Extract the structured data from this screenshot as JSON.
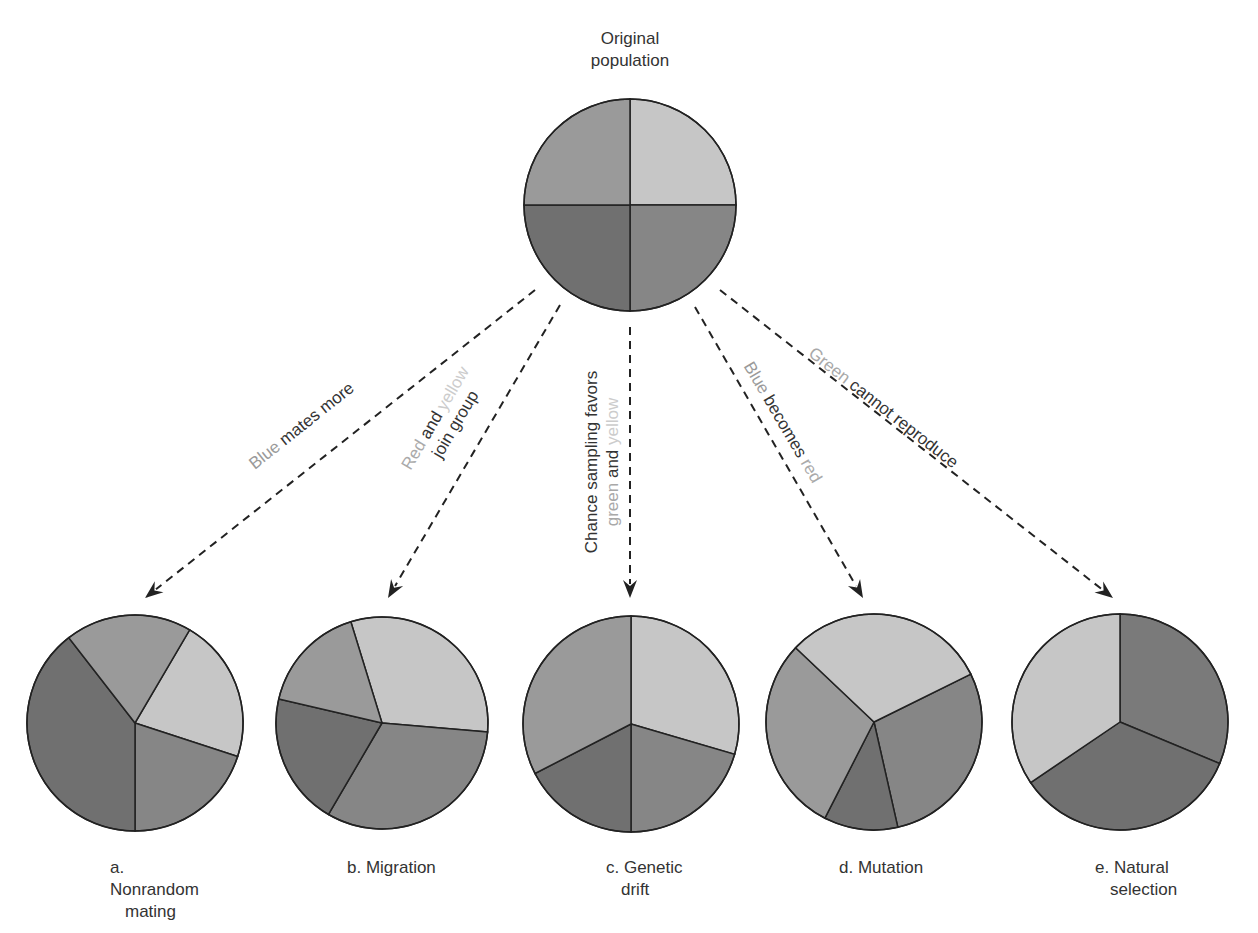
{
  "title": {
    "line1": "Original",
    "line2": "population"
  },
  "shades": {
    "green": "#9a9a9a",
    "yellow": "#c6c6c6",
    "blue": "#707070",
    "red": "#868686",
    "stroke": "#222222"
  },
  "word_colors": {
    "blue": "#9a9a9a",
    "red": "#aaaaaa",
    "yellow": "#cccccc",
    "green": "#a8a8a8",
    "text": "#333333"
  },
  "arrows": [
    {
      "id": "a",
      "words": [
        {
          "t": "Blue",
          "c": "blue"
        },
        {
          "t": " mates more",
          "c": "text"
        }
      ]
    },
    {
      "id": "b",
      "line1": [
        {
          "t": "Red",
          "c": "red"
        },
        {
          "t": " and ",
          "c": "text"
        },
        {
          "t": "yellow",
          "c": "yellow"
        }
      ],
      "line2": [
        {
          "t": "join group",
          "c": "text"
        }
      ]
    },
    {
      "id": "c",
      "line1": [
        {
          "t": "Chance sampling favors",
          "c": "text"
        }
      ],
      "line2": [
        {
          "t": "green",
          "c": "green"
        },
        {
          "t": " and ",
          "c": "text"
        },
        {
          "t": "yellow",
          "c": "yellow"
        }
      ]
    },
    {
      "id": "d",
      "words": [
        {
          "t": "Blue",
          "c": "blue"
        },
        {
          "t": " becomes ",
          "c": "text"
        },
        {
          "t": "red",
          "c": "red"
        }
      ]
    },
    {
      "id": "e",
      "words": [
        {
          "t": "Green",
          "c": "green"
        },
        {
          "t": " cannot reproduce",
          "c": "text"
        }
      ]
    }
  ],
  "captions": [
    {
      "l1": "a. Nonrandom",
      "l2": "mating"
    },
    {
      "l1": "b. Migration",
      "l2": ""
    },
    {
      "l1": "c. Genetic",
      "l2": "drift"
    },
    {
      "l1": "d. Mutation",
      "l2": ""
    },
    {
      "l1": "e. Natural",
      "l2": "selection"
    }
  ],
  "chart_data": [
    {
      "type": "pie",
      "title": "Original population",
      "categories": [
        "green",
        "yellow",
        "red",
        "blue"
      ],
      "values": [
        25,
        25,
        25,
        25
      ]
    },
    {
      "type": "pie",
      "title": "a. Nonrandom mating",
      "categories": [
        "green",
        "yellow",
        "red",
        "blue"
      ],
      "values": [
        16,
        17,
        20,
        47
      ]
    },
    {
      "type": "pie",
      "title": "b. Migration",
      "categories": [
        "green",
        "yellow",
        "red",
        "blue"
      ],
      "values": [
        16,
        33,
        36,
        15
      ]
    },
    {
      "type": "pie",
      "title": "c. Genetic drift",
      "categories": [
        "green",
        "yellow",
        "red",
        "blue"
      ],
      "values": [
        35,
        30,
        17,
        18
      ]
    },
    {
      "type": "pie",
      "title": "d. Mutation",
      "categories": [
        "green",
        "yellow",
        "red",
        "blue"
      ],
      "values": [
        30,
        28,
        32,
        10
      ]
    },
    {
      "type": "pie",
      "title": "e. Natural selection",
      "categories": [
        "yellow",
        "red",
        "blue"
      ],
      "values": [
        33,
        33,
        34
      ]
    }
  ]
}
